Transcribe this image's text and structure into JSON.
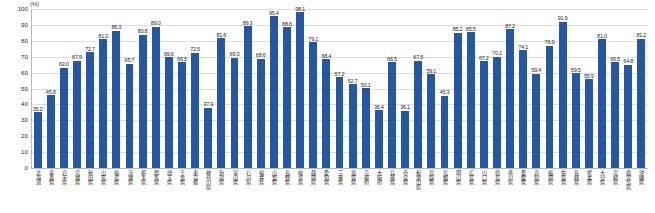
{
  "chart_data": {
    "type": "bar",
    "title": "",
    "subtitle": "",
    "xlabel": "",
    "ylabel": "",
    "unit_label": "(%)",
    "ylim": [
      0,
      100
    ],
    "y_ticks": [
      0,
      10,
      20,
      30,
      40,
      50,
      60,
      70,
      80,
      90,
      100
    ],
    "grid": true,
    "legend": "none",
    "bar_color": "#2558a4",
    "categories": [
      "北海道",
      "青森県",
      "岩手県",
      "宮城県",
      "秋田県",
      "山形県",
      "福島県",
      "茨城県",
      "栃木県",
      "群馬県",
      "埼玉県",
      "千葉県",
      "東京都",
      "神奈川県",
      "新潟県",
      "富山県",
      "石川県",
      "福井県",
      "山梨県",
      "長野県",
      "岐阜県",
      "静岡県",
      "愛知県",
      "三重県",
      "滋賀県",
      "京都府",
      "大阪府",
      "兵庫県",
      "奈良県",
      "和歌山県",
      "鳥取県",
      "島根県",
      "岡山県",
      "広島県",
      "山口県",
      "徳島県",
      "香川県",
      "愛媛県",
      "高知県",
      "福岡県",
      "佐賀県",
      "長崎県",
      "熊本県",
      "大分県",
      "宮崎県",
      "鹿児島県",
      "沖縄県"
    ],
    "values": [
      35.2,
      45.8,
      63.0,
      67.5,
      72.7,
      81.0,
      86.3,
      65.7,
      83.8,
      89.0,
      69.6,
      66.5,
      72.5,
      37.9,
      81.6,
      69.3,
      89.3,
      68.6,
      95.4,
      88.6,
      98.1,
      79.1,
      68.4,
      57.2,
      52.7,
      50.1,
      36.4,
      66.5,
      36.1,
      67.5,
      59.1,
      45.3,
      85.2,
      85.5,
      67.2,
      70.1,
      87.2,
      74.1,
      59.4,
      76.9,
      91.9,
      59.5,
      55.9,
      81.0,
      66.5,
      64.8,
      81.2
    ]
  }
}
